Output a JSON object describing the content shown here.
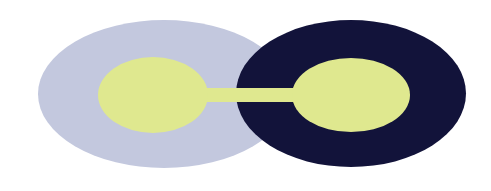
{
  "canvas": {
    "width": 491,
    "height": 191,
    "background_color": "#ffffff",
    "title": "Two overlapping ellipses joined by a bar"
  },
  "palette": {
    "lavender": "#c3c8de",
    "navy": "#12133a",
    "yellow_green": "#dfe88f",
    "white": "#ffffff"
  },
  "shapes": {
    "left_outer_ellipse": {
      "name": "left-outer-ellipse",
      "fill": "#c3c8de",
      "cx": 164,
      "cy": 94,
      "rx": 126,
      "ry": 74
    },
    "right_outer_ellipse": {
      "name": "right-outer-ellipse",
      "fill": "#12133a",
      "cx": 351,
      "cy": 93.5,
      "rx": 115,
      "ry": 73.5
    },
    "left_inner_ellipse": {
      "name": "left-inner-ellipse",
      "fill": "#dfe88f",
      "cx": 153,
      "cy": 95,
      "rx": 55,
      "ry": 38
    },
    "right_inner_ellipse": {
      "name": "right-inner-ellipse",
      "fill": "#dfe88f",
      "cx": 351,
      "cy": 95,
      "rx": 59,
      "ry": 37
    },
    "connector_bar": {
      "name": "connector-bar",
      "fill": "#dfe88f",
      "x": 150,
      "y": 88,
      "width": 205,
      "height": 14
    }
  }
}
